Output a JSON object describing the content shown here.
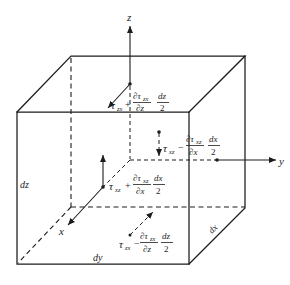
{
  "figure": {
    "axes": {
      "x": "x",
      "y": "y",
      "z": "z"
    },
    "edge_labels": {
      "dx": "dx",
      "dy": "dy",
      "dz": "dz"
    },
    "stresses": {
      "top": {
        "tau": "τ",
        "sub": "zx",
        "sign": "+",
        "num": "∂τ",
        "num_sub": "zx",
        "den": "∂z",
        "half_num": "dz",
        "half_den": "2"
      },
      "back": {
        "tau": "τ",
        "sub": "xz",
        "sign": "−",
        "num": "∂τ",
        "num_sub": "xz",
        "den": "∂x",
        "half_num": "dx",
        "half_den": "2"
      },
      "front": {
        "tau": "τ",
        "sub": "xz",
        "sign": "+",
        "num": "∂τ",
        "num_sub": "xz",
        "den": "∂x",
        "half_num": "dx",
        "half_den": "2"
      },
      "bottom": {
        "tau": "τ",
        "sub": "zx",
        "sign": "−",
        "num": "∂τ",
        "num_sub": "zx",
        "den": "∂z",
        "half_num": "dz",
        "half_den": "2"
      }
    },
    "colors": {
      "ink": "#1c1c1c",
      "background": "#ffffff"
    }
  }
}
